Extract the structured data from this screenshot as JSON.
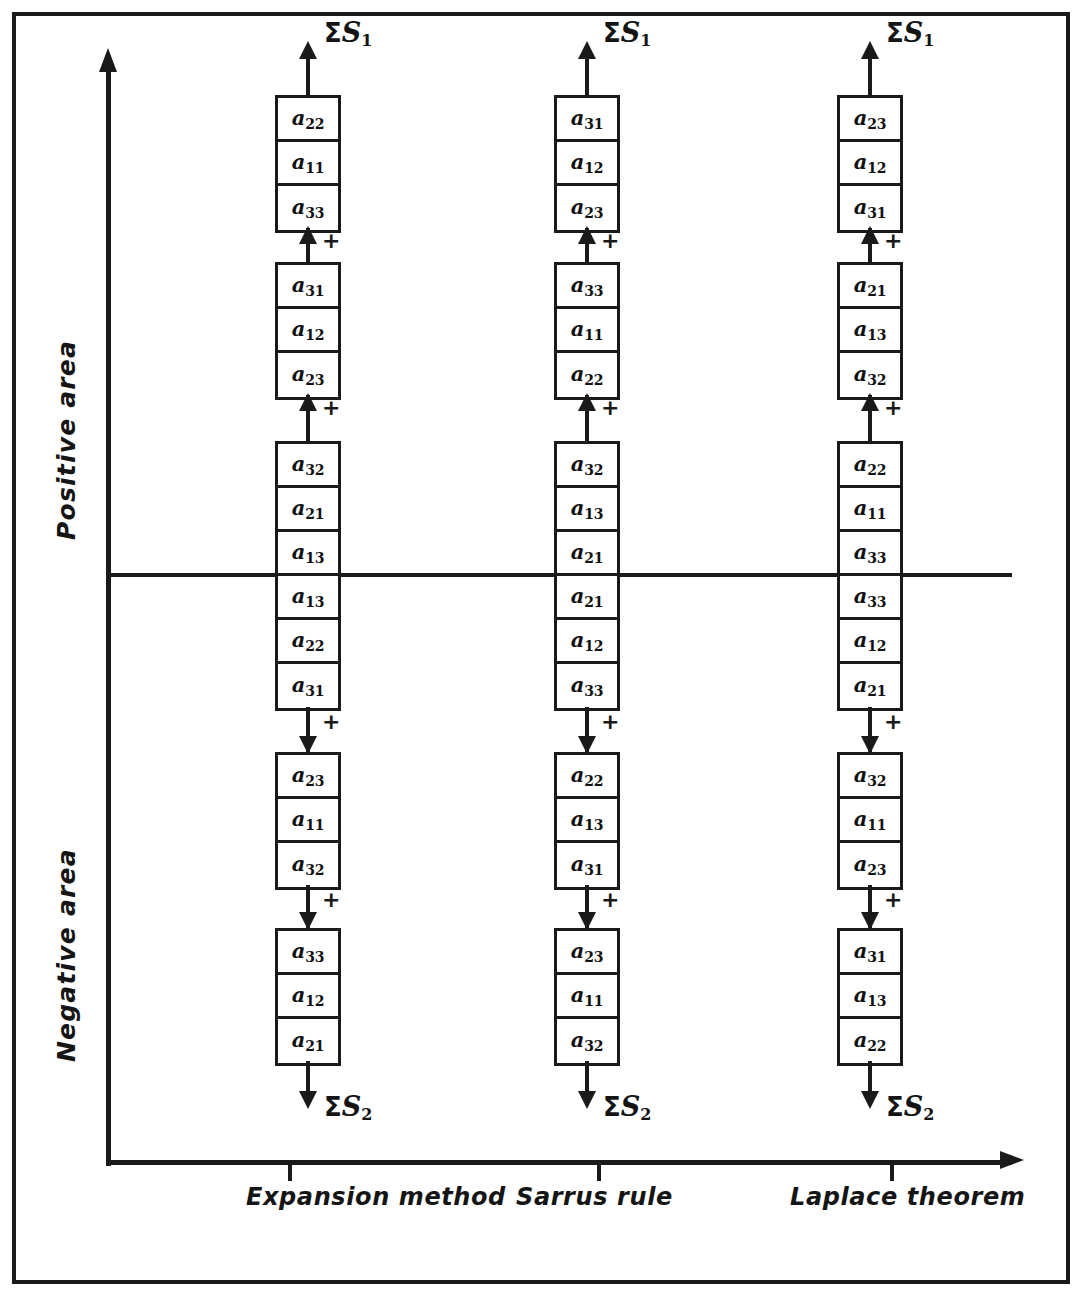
{
  "diagram": {
    "y_axis": {
      "positive_label": "Positive  area",
      "negative_label": "Negative  area"
    },
    "x_axis": {
      "categories": [
        "Expansion method",
        "Sarrus rule",
        "Laplace theorem"
      ]
    },
    "sum_top_label": "S",
    "sum_top_sub": "1",
    "sum_bottom_label": "S",
    "sum_bottom_sub": "2",
    "sigma": "Σ",
    "plus_sign": "+"
  },
  "chart_data": {
    "type": "diagram",
    "xlabel": "",
    "ylabel": "",
    "categories": [
      "Expansion method",
      "Sarrus rule",
      "Laplace theorem"
    ],
    "regions": [
      "Positive area",
      "Negative area"
    ],
    "columns": [
      {
        "name": "Expansion method",
        "x_center": 308,
        "positive_blocks": [
          {
            "terms": [
              {
                "a": "a",
                "idx": "22"
              },
              {
                "a": "a",
                "idx": "11"
              },
              {
                "a": "a",
                "idx": "33"
              }
            ]
          },
          {
            "terms": [
              {
                "a": "a",
                "idx": "31"
              },
              {
                "a": "a",
                "idx": "12"
              },
              {
                "a": "a",
                "idx": "23"
              }
            ]
          },
          {
            "terms": [
              {
                "a": "a",
                "idx": "32"
              },
              {
                "a": "a",
                "idx": "21"
              },
              {
                "a": "a",
                "idx": "13"
              }
            ]
          }
        ],
        "negative_blocks": [
          {
            "terms": [
              {
                "a": "a",
                "idx": "13"
              },
              {
                "a": "a",
                "idx": "22"
              },
              {
                "a": "a",
                "idx": "31"
              }
            ]
          },
          {
            "terms": [
              {
                "a": "a",
                "idx": "23"
              },
              {
                "a": "a",
                "idx": "11"
              },
              {
                "a": "a",
                "idx": "32"
              }
            ]
          },
          {
            "terms": [
              {
                "a": "a",
                "idx": "33"
              },
              {
                "a": "a",
                "idx": "12"
              },
              {
                "a": "a",
                "idx": "21"
              }
            ]
          }
        ]
      },
      {
        "name": "Sarrus rule",
        "x_center": 587,
        "positive_blocks": [
          {
            "terms": [
              {
                "a": "a",
                "idx": "31"
              },
              {
                "a": "a",
                "idx": "12"
              },
              {
                "a": "a",
                "idx": "23"
              }
            ]
          },
          {
            "terms": [
              {
                "a": "a",
                "idx": "33"
              },
              {
                "a": "a",
                "idx": "11"
              },
              {
                "a": "a",
                "idx": "22"
              }
            ]
          },
          {
            "terms": [
              {
                "a": "a",
                "idx": "32"
              },
              {
                "a": "a",
                "idx": "13"
              },
              {
                "a": "a",
                "idx": "21"
              }
            ]
          }
        ],
        "negative_blocks": [
          {
            "terms": [
              {
                "a": "a",
                "idx": "21"
              },
              {
                "a": "a",
                "idx": "12"
              },
              {
                "a": "a",
                "idx": "33"
              }
            ]
          },
          {
            "terms": [
              {
                "a": "a",
                "idx": "22"
              },
              {
                "a": "a",
                "idx": "13"
              },
              {
                "a": "a",
                "idx": "31"
              }
            ]
          },
          {
            "terms": [
              {
                "a": "a",
                "idx": "23"
              },
              {
                "a": "a",
                "idx": "11"
              },
              {
                "a": "a",
                "idx": "32"
              }
            ]
          }
        ]
      },
      {
        "name": "Laplace theorem",
        "x_center": 870,
        "positive_blocks": [
          {
            "terms": [
              {
                "a": "a",
                "idx": "23"
              },
              {
                "a": "a",
                "idx": "12"
              },
              {
                "a": "a",
                "idx": "31"
              }
            ]
          },
          {
            "terms": [
              {
                "a": "a",
                "idx": "21"
              },
              {
                "a": "a",
                "idx": "13"
              },
              {
                "a": "a",
                "idx": "32"
              }
            ]
          },
          {
            "terms": [
              {
                "a": "a",
                "idx": "22"
              },
              {
                "a": "a",
                "idx": "11"
              },
              {
                "a": "a",
                "idx": "33"
              }
            ]
          }
        ],
        "negative_blocks": [
          {
            "terms": [
              {
                "a": "a",
                "idx": "33"
              },
              {
                "a": "a",
                "idx": "12"
              },
              {
                "a": "a",
                "idx": "21"
              }
            ]
          },
          {
            "terms": [
              {
                "a": "a",
                "idx": "32"
              },
              {
                "a": "a",
                "idx": "11"
              },
              {
                "a": "a",
                "idx": "23"
              }
            ]
          },
          {
            "terms": [
              {
                "a": "a",
                "idx": "31"
              },
              {
                "a": "a",
                "idx": "13"
              },
              {
                "a": "a",
                "idx": "22"
              }
            ]
          }
        ]
      }
    ],
    "layout": {
      "zero_axis_y": 575,
      "x_axis_y": 1162,
      "y_axis_x": 108,
      "block_height": 133,
      "cell_height": 44,
      "block_width": 66,
      "positive_block_tops": [
        95,
        262,
        441
      ],
      "negative_block_tops": [
        577,
        752,
        928
      ]
    },
    "colors": {
      "ink": "#1a1a1a",
      "paper": "#ffffff"
    }
  }
}
